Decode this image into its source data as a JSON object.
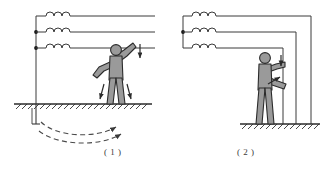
{
  "figure": {
    "background_color": "#ffffff",
    "line_color": "#3a3a3a",
    "body_fill": "#9a9a9a",
    "body_stroke": "#2b2b2b",
    "ground_color": "#2b2b2b",
    "dashed_color": "#4a4a4a"
  },
  "panels": [
    {
      "id": "panel-1",
      "caption": "( 1 )",
      "scenario": "single-phase contact with ground return",
      "source": {
        "type": "three-phase-windings",
        "winding_count": 3,
        "bumps_per_winding": 3,
        "junction_dots": 2,
        "neutral_grounded": true
      },
      "person": {
        "posture": "standing, right arm raised touching overhead line",
        "contact_points": 1,
        "contact_target": "lowest phase conductor"
      },
      "current_arrows": {
        "hand_arrow": "down",
        "leg_arrows": "down",
        "count": 3
      },
      "ground": {
        "hatching": true,
        "electrode": "vertical rod",
        "return_arcs": 2,
        "arc_style": "dashed with arrowheads"
      }
    },
    {
      "id": "panel-2",
      "caption": "( 2 )",
      "scenario": "two-phase contact between conductors",
      "source": {
        "type": "three-phase-windings",
        "winding_count": 3,
        "bumps_per_winding": 3,
        "junction_dots": 1,
        "neutral_grounded": false
      },
      "person": {
        "posture": "standing, both hands gripping two vertical droppers",
        "contact_points": 2,
        "contact_target": "two phase conductors"
      },
      "current_arrows": {
        "upper_arrow": "down",
        "lower_arrow": "up-right",
        "count": 2
      },
      "ground": {
        "hatching": true,
        "electrode": "none",
        "return_arcs": 0
      }
    }
  ],
  "captions": {
    "panel_1": "( 1 )",
    "panel_2": "( 2 )"
  }
}
